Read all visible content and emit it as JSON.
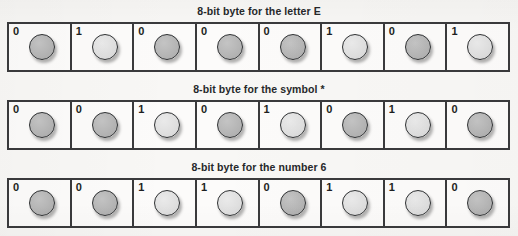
{
  "figure": {
    "bit_zero_label": "0",
    "bit_one_label": "1",
    "bytes": [
      {
        "caption": "8-bit byte for the letter E",
        "bits": [
          "0",
          "1",
          "0",
          "0",
          "0",
          "1",
          "0",
          "1"
        ]
      },
      {
        "caption": "8-bit byte for the symbol *",
        "bits": [
          "0",
          "0",
          "1",
          "0",
          "1",
          "0",
          "1",
          "0"
        ]
      },
      {
        "caption": "8-bit byte for the number 6",
        "bits": [
          "0",
          "0",
          "1",
          "1",
          "0",
          "1",
          "1",
          "0"
        ]
      }
    ],
    "colors": {
      "page_background": "#f8f7f5",
      "cell_background": "#fcfbfa",
      "border": "#3a3a3c",
      "caption_text": "#26282a",
      "bit_label_text": "#1d1f21",
      "dot_zero": "#b4b4b4",
      "dot_one": "#dedede"
    }
  }
}
